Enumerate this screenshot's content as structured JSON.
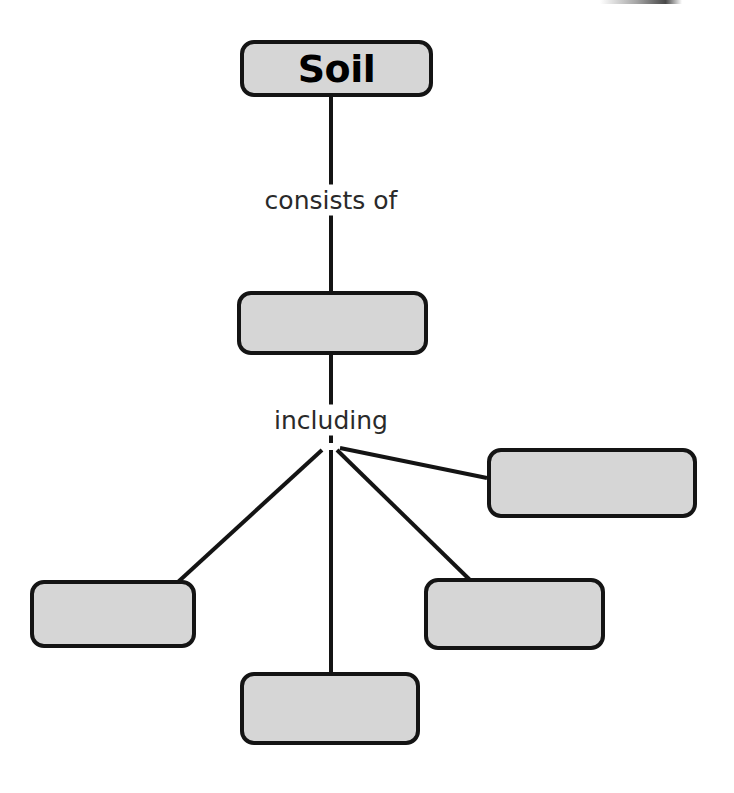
{
  "diagram": {
    "title": "Soil",
    "type": "concept-map-worksheet",
    "root": {
      "label": "Soil",
      "filled": true,
      "x": 240,
      "y": 40,
      "w": 193,
      "h": 57
    },
    "connector_labels": [
      {
        "text": "consists of",
        "x": 331,
        "y": 200
      },
      {
        "text": "including",
        "x": 331,
        "y": 420
      }
    ],
    "blank_boxes": [
      {
        "name": "component-box",
        "label": "",
        "x": 237,
        "y": 291,
        "w": 191,
        "h": 64
      },
      {
        "name": "item-box-right",
        "label": "",
        "x": 487,
        "y": 448,
        "w": 210,
        "h": 70
      },
      {
        "name": "item-box-left",
        "label": "",
        "x": 30,
        "y": 580,
        "w": 166,
        "h": 68
      },
      {
        "name": "item-box-bottom",
        "label": "",
        "x": 240,
        "y": 672,
        "w": 180,
        "h": 73
      },
      {
        "name": "item-box-center-right",
        "label": "",
        "x": 424,
        "y": 578,
        "w": 181,
        "h": 72
      }
    ],
    "branch_point": {
      "x": 331,
      "y": 443
    },
    "edges": [
      {
        "name": "root-to-component-upper",
        "x1": 331,
        "y1": 97,
        "x2": 331,
        "y2": 186
      },
      {
        "name": "root-to-component-lower",
        "x1": 331,
        "y1": 214,
        "x2": 331,
        "y2": 291
      },
      {
        "name": "component-to-branch-upper",
        "x1": 331,
        "y1": 355,
        "x2": 331,
        "y2": 406
      },
      {
        "name": "component-to-branch-lower",
        "x1": 331,
        "y1": 434,
        "x2": 331,
        "y2": 443
      },
      {
        "name": "branch-to-right-box",
        "x1": 340,
        "y1": 448,
        "x2": 487,
        "y2": 478
      },
      {
        "name": "branch-to-left-box",
        "x1": 322,
        "y1": 450,
        "x2": 178,
        "y2": 582
      },
      {
        "name": "branch-to-bottom-box",
        "x1": 331,
        "y1": 450,
        "x2": 331,
        "y2": 672
      },
      {
        "name": "branch-to-center-right-box",
        "x1": 337,
        "y1": 450,
        "x2": 470,
        "y2": 580
      }
    ],
    "colors": {
      "box_fill": "#d6d6d6",
      "box_border": "#141414",
      "label_text": "#2a2a2a",
      "title_text": "#000000",
      "background": "#ffffff"
    }
  }
}
